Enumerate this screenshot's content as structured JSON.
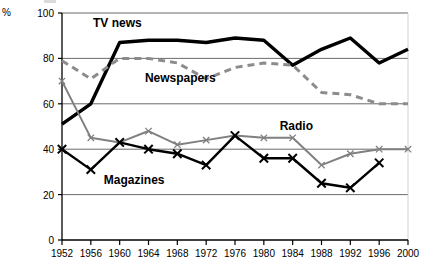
{
  "chart_data": {
    "type": "line",
    "title": "",
    "xlabel": "",
    "ylabel": "%",
    "ylim": [
      0,
      100
    ],
    "yticks": [
      0,
      20,
      40,
      60,
      80,
      100
    ],
    "grid": true,
    "grid_axis": "y",
    "legend_position": "inline-annotations",
    "categories": [
      1952,
      1956,
      1960,
      1964,
      1968,
      1972,
      1976,
      1980,
      1984,
      1988,
      1992,
      1996,
      2000
    ],
    "xtick_labels": [
      "1952",
      "1956",
      "1960",
      "1964",
      "1968",
      "1972",
      "1976",
      "1980",
      "1984",
      "1988",
      "1992",
      "1996",
      "2000"
    ],
    "ytick_labels": [
      "0",
      "20",
      "40",
      "60",
      "80",
      "100"
    ],
    "series": [
      {
        "name": "TV news",
        "style": "solid-thick-black",
        "color": "#000000",
        "marker": "none",
        "values": [
          51,
          60,
          87,
          88,
          88,
          87,
          89,
          88,
          77,
          84,
          89,
          78,
          84
        ]
      },
      {
        "name": "Newspapers",
        "style": "dashed-gray",
        "color": "#8c8c8c",
        "marker": "none",
        "values": [
          79,
          71,
          80,
          80,
          78,
          71,
          76,
          78,
          77,
          65,
          64,
          60,
          60
        ]
      },
      {
        "name": "Radio",
        "style": "solid-gray",
        "color": "#808080",
        "marker": "plus",
        "values": [
          70,
          45,
          43,
          48,
          42,
          44,
          46,
          45,
          45,
          33,
          38,
          40,
          40
        ]
      },
      {
        "name": "Magazines",
        "style": "solid-black",
        "color": "#000000",
        "marker": "x",
        "values": [
          40,
          31,
          43,
          40,
          38,
          33,
          46,
          36,
          36,
          25,
          23,
          34,
          null
        ]
      }
    ],
    "annotations": [
      {
        "text": "TV news",
        "x": 1956.3,
        "y": 95
      },
      {
        "text": "Newspapers",
        "x": 1963.5,
        "y": 71
      },
      {
        "text": "Radio",
        "x": 1982.2,
        "y": 50
      },
      {
        "text": "Magazines",
        "x": 1957.8,
        "y": 26
      }
    ]
  },
  "axis": {
    "unit_label": "%"
  }
}
